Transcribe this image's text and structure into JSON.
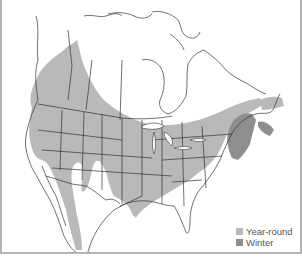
{
  "map": {
    "type": "species-range-map",
    "region": "North America",
    "colors": {
      "year_round": "#b9b9b9",
      "winter": "#8e8e8e",
      "land_outline": "#333333",
      "background": "#ffffff",
      "frame": "#b4b4b4"
    }
  },
  "legend": {
    "items": [
      {
        "label": "Year-round",
        "color": "#b9b9b9"
      },
      {
        "label": "Winter",
        "color": "#8e8e8e"
      }
    ]
  }
}
